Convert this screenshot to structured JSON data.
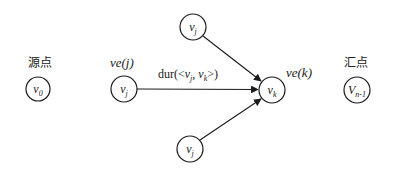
{
  "caption_fragment": "",
  "colors": {
    "stroke": "#1a1a1a",
    "background": "#ffffff"
  },
  "labels": {
    "source": "源点",
    "sink": "汇点",
    "ve_j": "ve(j)",
    "ve_k": "ve(k)",
    "dur_prefix": "dur(<",
    "dur_v": "v",
    "dur_j": "j",
    "dur_sep": ", ",
    "dur_k": "k",
    "dur_suffix": ">)"
  },
  "nodes": [
    {
      "id": "v0",
      "base": "v",
      "sub": "0",
      "cx": 38,
      "cy": 89,
      "r": 12
    },
    {
      "id": "vj_left",
      "base": "v",
      "sub": "j",
      "cx": 124,
      "cy": 89,
      "r": 13
    },
    {
      "id": "vj_top",
      "base": "v",
      "sub": "j",
      "cx": 193,
      "cy": 27,
      "r": 13
    },
    {
      "id": "vk",
      "base": "v",
      "sub": "k",
      "cx": 272,
      "cy": 90,
      "r": 13
    },
    {
      "id": "vj_bottom",
      "base": "v",
      "sub": "j",
      "cx": 190,
      "cy": 149,
      "r": 13
    },
    {
      "id": "vn1",
      "base": "V",
      "sub": "n-1",
      "cx": 357,
      "cy": 90,
      "r": 13
    }
  ],
  "edges": [
    {
      "from": "vj_left",
      "to": "vk",
      "label": "dur(<vj, vk>)"
    },
    {
      "from": "vj_top",
      "to": "vk"
    },
    {
      "from": "vj_bottom",
      "to": "vk"
    }
  ]
}
